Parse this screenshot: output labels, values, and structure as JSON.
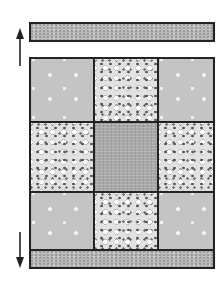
{
  "diagram": {
    "top_strip": {
      "pattern": "fine-speckled-gray"
    },
    "bottom_strip": {
      "pattern": "fine-speckled-gray"
    },
    "grid": {
      "rows": 3,
      "columns": 3,
      "cells": [
        [
          "plain-gray-with-white-dots",
          "dense-dotted-light",
          "plain-gray-with-white-dots"
        ],
        [
          "dense-dotted-light",
          "textured-dark-gray",
          "dense-dotted-light"
        ],
        [
          "plain-gray-with-white-dots",
          "dense-dotted-light",
          "plain-gray-with-white-dots"
        ]
      ]
    },
    "arrows": [
      {
        "name": "up-arrow",
        "direction": "up"
      },
      {
        "name": "down-arrow",
        "direction": "down"
      }
    ],
    "colors": {
      "outline": "#222222",
      "plain_fabric": "#c4c4c4",
      "dotted_fabric": "#e2e2e2",
      "center_fabric": "#a8a8a8",
      "strip_fabric": "#b8b8b8"
    }
  }
}
